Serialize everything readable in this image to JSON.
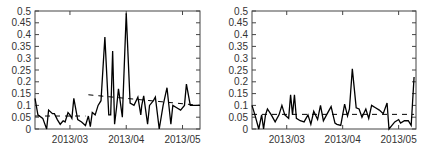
{
  "chart_data": [
    {
      "type": "line",
      "title": "",
      "xlabel": "",
      "ylabel": "",
      "ylim": [
        0,
        0.5
      ],
      "yticks": [
        "0",
        "0.05",
        "0.1",
        "0.15",
        "0.2",
        "0.25",
        "0.3",
        "0.35",
        "0.4",
        "0.45",
        "0.5"
      ],
      "xticks": [
        "2013/03",
        "2013/04",
        "2013/05"
      ],
      "grid": false,
      "legend": null,
      "series": [
        {
          "name": "observed",
          "style": "solid",
          "color": "#000000",
          "x": [
            0,
            1.5,
            4,
            6,
            7,
            9,
            10,
            11.5,
            13,
            14.5,
            15.5,
            17,
            18,
            19,
            20,
            22,
            24,
            26,
            27.5,
            28.5,
            29.5,
            31,
            32.5,
            34,
            36,
            38,
            39,
            40,
            41,
            42,
            43,
            45,
            47,
            49,
            51,
            53,
            54.5,
            55,
            56,
            57,
            58,
            59,
            61,
            62,
            64,
            66,
            68,
            70,
            71,
            73,
            75,
            77,
            78,
            80,
            82,
            83,
            84,
            85
          ],
          "values": [
            0.13,
            0.06,
            0.045,
            0.0,
            0.08,
            0.065,
            0.065,
            0.04,
            0.02,
            0.035,
            0.03,
            0.07,
            0.06,
            0.045,
            0.13,
            0.04,
            0.03,
            0.015,
            0.055,
            0.01,
            0.07,
            0.06,
            0.1,
            0.12,
            0.39,
            0.06,
            0.06,
            0.33,
            0.02,
            0.09,
            0.17,
            0.05,
            0.49,
            0.11,
            0.1,
            0.135,
            0.06,
            0.1,
            0.14,
            0.08,
            0.02,
            0.1,
            0.12,
            0.135,
            0.0,
            0.1,
            0.175,
            0.02,
            0.1,
            0.09,
            0.08,
            0.1,
            0.19,
            0.1,
            0.1,
            0.1,
            0.1,
            0.1
          ]
        },
        {
          "name": "baseline",
          "style": "dashed",
          "color": "#000000",
          "segments": [
            {
              "x": [
                0,
                26
              ],
              "values": [
                0.055,
                0.055
              ]
            },
            {
              "x": [
                27.5,
                85
              ],
              "values": [
                0.145,
                0.1
              ]
            }
          ]
        }
      ]
    },
    {
      "type": "line",
      "title": "",
      "xlabel": "",
      "ylabel": "",
      "ylim": [
        0,
        0.5
      ],
      "yticks": [
        "0",
        "0.05",
        "0.1",
        "0.15",
        "0.2",
        "0.25",
        "0.3",
        "0.35",
        "0.4",
        "0.45",
        "0.5"
      ],
      "xticks": [
        "2013/03",
        "2013/04",
        "2013/05"
      ],
      "grid": false,
      "legend": null,
      "series": [
        {
          "name": "observed",
          "style": "solid",
          "color": "#000000",
          "x": [
            0,
            1.5,
            3.5,
            5,
            6,
            7,
            8,
            10,
            12,
            14,
            15.5,
            17,
            19,
            20,
            21,
            22,
            23,
            25,
            27,
            29,
            30.5,
            32,
            34,
            35.5,
            37,
            39,
            41,
            43,
            44,
            46,
            48,
            49.5,
            50.5,
            52,
            54,
            55.5,
            57,
            59,
            60.5,
            62,
            64,
            66,
            68,
            70,
            71,
            72,
            74,
            76,
            77,
            79,
            81,
            82.5,
            84
          ],
          "values": [
            0.1,
            0.06,
            0.0,
            0.06,
            0.0,
            0.06,
            0.085,
            0.06,
            0.03,
            0.06,
            0.1,
            0.06,
            0.045,
            0.145,
            0.06,
            0.145,
            0.045,
            0.035,
            0.03,
            0.06,
            0.02,
            0.075,
            0.04,
            0.1,
            0.035,
            0.065,
            0.095,
            0.025,
            0.02,
            0.015,
            0.105,
            0.055,
            0.085,
            0.255,
            0.09,
            0.085,
            0.05,
            0.085,
            0.045,
            0.1,
            0.09,
            0.08,
            0.065,
            0.11,
            0.0,
            0.01,
            0.03,
            0.04,
            0.025,
            0.035,
            0.035,
            0.015,
            0.22
          ]
        },
        {
          "name": "baseline",
          "style": "dashed",
          "color": "#000000",
          "segments": [
            {
              "x": [
                0,
                84
              ],
              "values": [
                0.062,
                0.062
              ]
            }
          ]
        }
      ]
    }
  ]
}
